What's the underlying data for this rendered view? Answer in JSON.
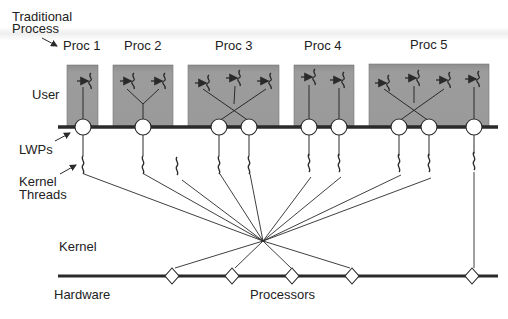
{
  "diagram": {
    "title_label": "Traditional Process",
    "title_line1": "Traditional",
    "title_line2": "Process",
    "layers": {
      "user": "User",
      "lwps": "LWPs",
      "kernel_threads_line1": "Kernel",
      "kernel_threads_line2": "Threads",
      "kernel": "Kernel",
      "hardware": "Hardware",
      "processors": "Processors"
    },
    "processes": [
      {
        "label": "Proc 1",
        "user_threads": 1,
        "lwps": 1
      },
      {
        "label": "Proc 2",
        "user_threads": 2,
        "lwps": 1
      },
      {
        "label": "Proc 3",
        "user_threads": 3,
        "lwps": 2
      },
      {
        "label": "Proc 4",
        "user_threads": 2,
        "lwps": 2
      },
      {
        "label": "Proc 5",
        "user_threads": 4,
        "lwps": 3
      }
    ],
    "kernel_thread_count": 10,
    "processor_count": 5,
    "colors": {
      "process_box": "#9a9a9a",
      "process_box_top": "#8a8a8a",
      "line": "#2a2a2a",
      "node_fill": "#ffffff"
    }
  }
}
